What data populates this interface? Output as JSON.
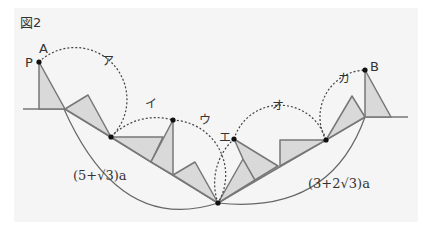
{
  "figure": {
    "title": "図2",
    "background": "#f5f5f5",
    "fill_color": "#d9d9d9",
    "stroke_color": "#777777",
    "point_labels": {
      "P": "P",
      "A": "A",
      "B": "B"
    },
    "arc_labels": [
      "ア",
      "イ",
      "ウ",
      "エ",
      "オ",
      "カ"
    ],
    "lengths": {
      "left": "(5+√3)a",
      "right": "(3+2√3)a"
    }
  }
}
